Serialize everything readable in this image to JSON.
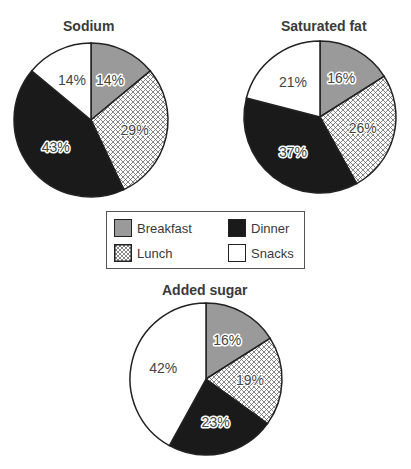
{
  "chart_data": [
    {
      "type": "pie",
      "title": "Sodium",
      "categories": [
        "Breakfast",
        "Lunch",
        "Dinner",
        "Snacks"
      ],
      "values": [
        14,
        29,
        43,
        14
      ],
      "labels": [
        "14%",
        "29%",
        "43%",
        "14%"
      ]
    },
    {
      "type": "pie",
      "title": "Saturated fat",
      "categories": [
        "Breakfast",
        "Lunch",
        "Dinner",
        "Snacks"
      ],
      "values": [
        16,
        26,
        37,
        21
      ],
      "labels": [
        "16%",
        "26%",
        "37%",
        "21%"
      ]
    },
    {
      "type": "pie",
      "title": "Added sugar",
      "categories": [
        "Breakfast",
        "Lunch",
        "Dinner",
        "Snacks"
      ],
      "values": [
        16,
        19,
        23,
        42
      ],
      "labels": [
        "16%",
        "19%",
        "23%",
        "42%"
      ]
    }
  ],
  "legend": {
    "items": [
      {
        "label": "Breakfast",
        "fill": "gray"
      },
      {
        "label": "Dinner",
        "fill": "black"
      },
      {
        "label": "Lunch",
        "fill": "crosshatch"
      },
      {
        "label": "Snacks",
        "fill": "white"
      }
    ]
  },
  "colors": {
    "breakfast": "#9a9a9a",
    "lunch_hatch": "#555555",
    "dinner": "#1a1a1a",
    "snacks": "#ffffff",
    "outline": "#222222"
  }
}
